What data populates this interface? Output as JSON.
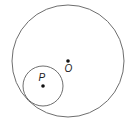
{
  "diagram": {
    "colors": {
      "stroke": "#6e6e6e",
      "point": "#111111",
      "label": "#222222",
      "background": "#ffffff"
    },
    "circles": [
      {
        "name": "large-circle",
        "center_label": "O",
        "cx": 68,
        "cy": 61,
        "r": 56
      },
      {
        "name": "small-circle",
        "center_label": "P",
        "cx": 43,
        "cy": 86,
        "r": 20
      }
    ],
    "points": [
      {
        "label": "O",
        "x": 68,
        "y": 61,
        "label_x": 64.5,
        "label_y": 72
      },
      {
        "label": "P",
        "x": 43,
        "y": 86,
        "label_x": 38.5,
        "label_y": 81
      }
    ]
  }
}
